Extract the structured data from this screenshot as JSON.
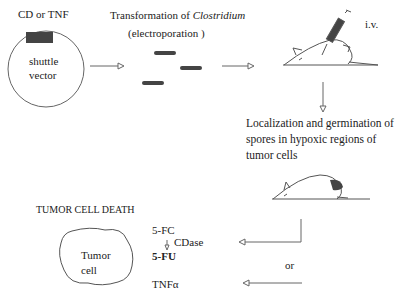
{
  "diagram": {
    "vector": {
      "insert_label": "CD or TNF",
      "plasmid_label_line1": "shuttle",
      "plasmid_label_line2": "vector"
    },
    "transformation": {
      "title_prefix": "Transformation of ",
      "organism": "Clostridium",
      "method": "(electroporation )"
    },
    "injection": {
      "route": "i.v."
    },
    "localization": {
      "line1": "Localization and germination of",
      "line2": "spores in hypoxic regions of",
      "line3": "tumor cells"
    },
    "outcome": {
      "title": "TUMOR CELL DEATH",
      "cell_line1": "Tumor",
      "cell_line2": "cell",
      "prodrug": "5-FC",
      "enzyme": "CDase",
      "drug": "5-FU",
      "alternative": "or",
      "cytokine": "TNFα"
    },
    "colors": {
      "line": "#555555",
      "fill_dark": "#444444",
      "text": "#222222"
    }
  }
}
